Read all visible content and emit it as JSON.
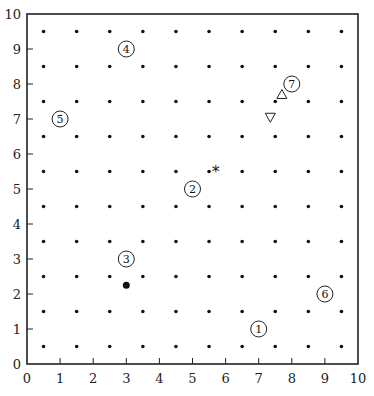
{
  "chart_data": {
    "type": "scatter",
    "title": "",
    "xlabel": "",
    "ylabel": "",
    "xlim": [
      0,
      10
    ],
    "ylim": [
      0,
      10
    ],
    "grid": false,
    "x_ticks": [
      "0",
      "1",
      "2",
      "3",
      "4",
      "5",
      "6",
      "7",
      "8",
      "9",
      "10"
    ],
    "y_ticks": [
      "0",
      "1",
      "2",
      "3",
      "4",
      "5",
      "6",
      "7",
      "8",
      "9",
      "10"
    ],
    "series": [
      {
        "name": "grid points",
        "marker": "small-dot",
        "x": [
          0.5,
          1.5,
          2.5,
          3.5,
          4.5,
          5.5,
          6.5,
          7.5,
          8.5,
          9.5
        ],
        "y": [
          0.5,
          1.5,
          2.5,
          3.5,
          4.5,
          5.5,
          6.5,
          7.5,
          8.5,
          9.5
        ],
        "note": "full 10x10 lattice at half-integer coordinates"
      },
      {
        "name": "numbered circles",
        "marker": "circled-number",
        "points": [
          {
            "label": "1",
            "x": 7.0,
            "y": 1.0
          },
          {
            "label": "2",
            "x": 5.0,
            "y": 5.0
          },
          {
            "label": "3",
            "x": 3.0,
            "y": 3.0
          },
          {
            "label": "4",
            "x": 3.0,
            "y": 9.0
          },
          {
            "label": "5",
            "x": 1.0,
            "y": 7.0
          },
          {
            "label": "6",
            "x": 9.0,
            "y": 2.0
          },
          {
            "label": "7",
            "x": 8.0,
            "y": 8.0
          }
        ]
      },
      {
        "name": "star",
        "marker": "asterisk",
        "points": [
          {
            "x": 5.7,
            "y": 5.6
          }
        ]
      },
      {
        "name": "filled dot",
        "marker": "large-dot",
        "points": [
          {
            "x": 3.0,
            "y": 2.25
          }
        ]
      },
      {
        "name": "triangle up",
        "marker": "triangle-up",
        "points": [
          {
            "x": 7.7,
            "y": 7.7
          }
        ]
      },
      {
        "name": "triangle down",
        "marker": "triangle-down",
        "points": [
          {
            "x": 7.35,
            "y": 7.05
          }
        ]
      }
    ]
  }
}
